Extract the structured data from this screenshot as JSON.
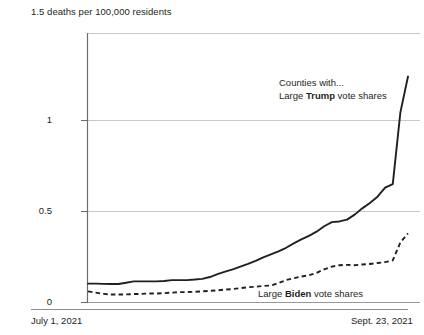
{
  "chart_data": {
    "type": "line",
    "title": "1.5 deaths per 100,000 residents",
    "xlabel": "",
    "ylabel": "deaths per 100,000 residents",
    "xlim_labels": [
      "July 1, 2021",
      "Sept. 23, 2021"
    ],
    "ylim": [
      0,
      1.5
    ],
    "yticks": [
      "0",
      "0.5",
      "1",
      "1.5"
    ],
    "ytick_values": [
      0,
      0.5,
      1,
      1.5
    ],
    "grid": true,
    "legend_position": "inline-annotations",
    "series": [
      {
        "name": "Counties with large Trump vote shares",
        "style": "solid",
        "color": "#231f20",
        "x": [
          0,
          2,
          4,
          6,
          8,
          10,
          12,
          14,
          16,
          18,
          20,
          22,
          24,
          26,
          28,
          30,
          32,
          34,
          36,
          38,
          40,
          42,
          44,
          46,
          48,
          50,
          52,
          54,
          56,
          58,
          60,
          62,
          64,
          66,
          68,
          70,
          72,
          74,
          76,
          78,
          80,
          82,
          84
        ],
        "values": [
          0.105,
          0.105,
          0.104,
          0.103,
          0.103,
          0.11,
          0.118,
          0.118,
          0.118,
          0.118,
          0.12,
          0.125,
          0.125,
          0.125,
          0.128,
          0.132,
          0.142,
          0.158,
          0.172,
          0.185,
          0.2,
          0.215,
          0.232,
          0.252,
          0.268,
          0.285,
          0.305,
          0.33,
          0.352,
          0.372,
          0.395,
          0.425,
          0.448,
          0.452,
          0.462,
          0.49,
          0.525,
          0.555,
          0.59,
          0.64,
          0.66,
          1.06,
          1.26
        ],
        "annotation": "Counties with...\nLarge Trump vote shares"
      },
      {
        "name": "Counties with large Biden vote shares",
        "style": "dashed",
        "color": "#231f20",
        "x": [
          0,
          2,
          4,
          6,
          8,
          10,
          12,
          14,
          16,
          18,
          20,
          22,
          24,
          26,
          28,
          30,
          32,
          34,
          36,
          38,
          40,
          42,
          44,
          46,
          48,
          50,
          52,
          54,
          56,
          58,
          60,
          62,
          64,
          66,
          68,
          70,
          72,
          74,
          76,
          78,
          80,
          82,
          84
        ],
        "values": [
          0.062,
          0.055,
          0.048,
          0.045,
          0.045,
          0.045,
          0.047,
          0.048,
          0.05,
          0.05,
          0.052,
          0.055,
          0.058,
          0.058,
          0.06,
          0.062,
          0.065,
          0.068,
          0.072,
          0.075,
          0.08,
          0.085,
          0.088,
          0.092,
          0.095,
          0.108,
          0.125,
          0.135,
          0.145,
          0.152,
          0.165,
          0.185,
          0.2,
          0.208,
          0.21,
          0.208,
          0.212,
          0.215,
          0.22,
          0.225,
          0.235,
          0.335,
          0.385
        ],
        "annotation": "Large Biden vote shares"
      }
    ]
  },
  "labels": {
    "axis_title": "1.5 deaths per 100,000 residents",
    "ytick_1": "1",
    "ytick_05": "0.5",
    "ytick_0": "0",
    "xtick_start": "July 1, 2021",
    "xtick_end": "Sept. 23, 2021",
    "annotation_trump_line1": "Counties with...",
    "annotation_trump_line2_pre": "Large ",
    "annotation_trump_line2_bold": "Trump",
    "annotation_trump_line2_post": " vote shares",
    "annotation_biden_pre": "Large ",
    "annotation_biden_bold": "Biden",
    "annotation_biden_post": " vote shares"
  },
  "colors": {
    "line": "#231f20",
    "grid": "#c9c9c9",
    "axis": "#6d6d6d",
    "text": "#231f20",
    "background": "#ffffff"
  }
}
